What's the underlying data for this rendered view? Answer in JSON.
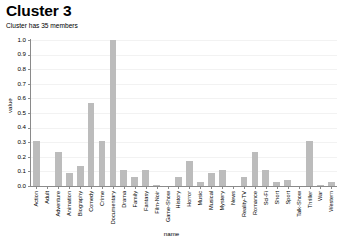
{
  "header": {
    "title": "Cluster 3",
    "subtitle": "Cluster has 35 members"
  },
  "axis_title": {
    "y": "value",
    "x": "name"
  },
  "style": {
    "bar_color": "#bcbcbc",
    "axis_color": "#8a8a8a",
    "grid_color": "#f2f2f2",
    "text_color": "#000000",
    "background": "#ffffff"
  },
  "chart_data": {
    "type": "bar",
    "title": "Cluster 3",
    "subtitle": "Cluster has 35 members",
    "xlabel": "name",
    "ylabel": "value",
    "ylim": [
      0.0,
      1.0
    ],
    "grid": true,
    "legend": "none",
    "ytick_labels": [
      "1.0",
      "0.9",
      "0.8",
      "0.7",
      "0.6",
      "0.5",
      "0.4",
      "0.3",
      "0.2",
      "0.1",
      "0.0"
    ],
    "ytick_values": [
      1.0,
      0.9,
      0.8,
      0.7,
      0.6,
      0.5,
      0.4,
      0.3,
      0.2,
      0.1,
      0.0
    ],
    "categories": [
      "Action",
      "Adult",
      "Adventure",
      "Animation",
      "Biography",
      "Comedy",
      "Crime",
      "Documentary",
      "Drama",
      "Family",
      "Fantasy",
      "Film-Noir",
      "Game-Show",
      "History",
      "Horror",
      "Music",
      "Musical",
      "Mystery",
      "News",
      "Reality-TV",
      "Romance",
      "Sci-Fi",
      "Short",
      "Sport",
      "Talk-Show",
      "Thriller",
      "War",
      "Western"
    ],
    "values": [
      0.31,
      0.0,
      0.23,
      0.09,
      0.14,
      0.57,
      0.31,
      1.0,
      0.11,
      0.06,
      0.11,
      0.01,
      0.0,
      0.06,
      0.17,
      0.03,
      0.09,
      0.11,
      0.0,
      0.06,
      0.23,
      0.11,
      0.03,
      0.04,
      0.0,
      0.31,
      0.01,
      0.03
    ]
  }
}
